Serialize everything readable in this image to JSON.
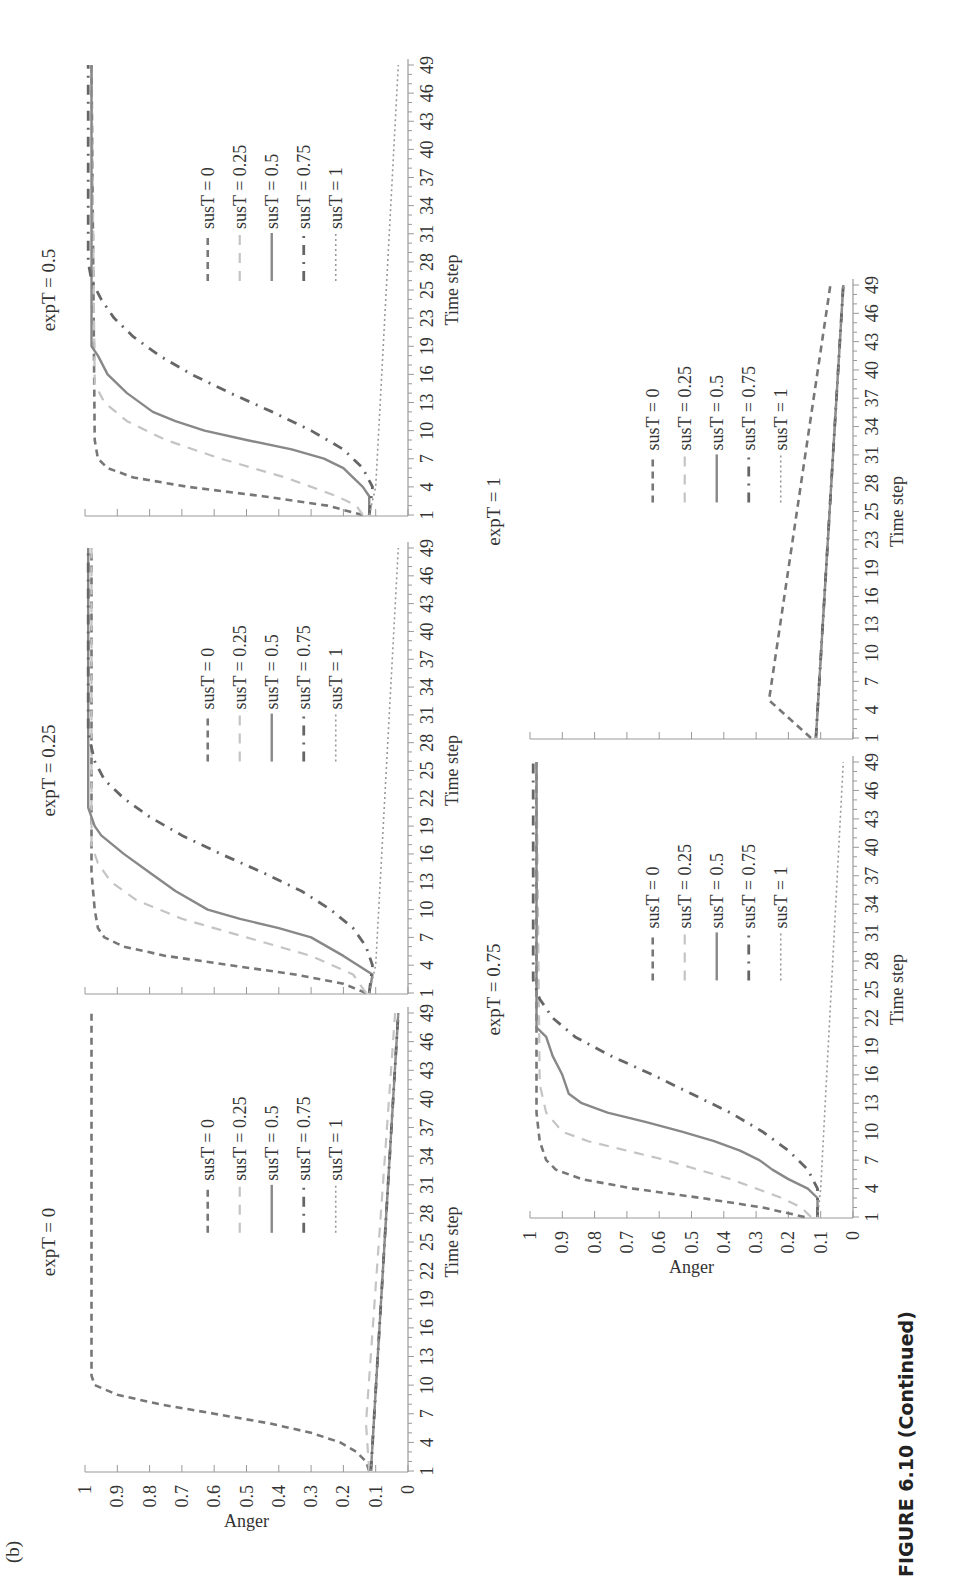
{
  "figure": {
    "panel_label": "(b)",
    "caption": "FIGURE 6.10 (Continued)"
  },
  "legend_labels": [
    "susT = 0",
    "susT = 0.25",
    "susT = 0.5",
    "susT = 0.75",
    "susT = 1"
  ],
  "axis": {
    "xlabel": "Time step",
    "ylabel": "Anger"
  },
  "chart_data": [
    {
      "type": "line",
      "title": "expT = 0",
      "xlabel": "Time step",
      "ylabel": "Anger",
      "ylim": [
        0,
        1
      ],
      "xlim": [
        1,
        49
      ],
      "x_ticks": [
        "1",
        "4",
        "7",
        "10",
        "13",
        "16",
        "19",
        "22",
        "25",
        "28",
        "31",
        "34",
        "37",
        "40",
        "43",
        "46",
        "49"
      ],
      "y_ticks": [
        "0",
        "0.1",
        "0.2",
        "0.3",
        "0.4",
        "0.5",
        "0.6",
        "0.7",
        "0.8",
        "0.9",
        "1"
      ],
      "show_ylabel": true,
      "series": [
        {
          "name": "susT = 0",
          "style": "dash",
          "points": [
            [
              1,
              0.12
            ],
            [
              2,
              0.13
            ],
            [
              3,
              0.16
            ],
            [
              4,
              0.21
            ],
            [
              5,
              0.3
            ],
            [
              6,
              0.43
            ],
            [
              7,
              0.6
            ],
            [
              8,
              0.77
            ],
            [
              9,
              0.9
            ],
            [
              10,
              0.97
            ],
            [
              11,
              0.98
            ],
            [
              49,
              0.98
            ]
          ]
        },
        {
          "name": "susT = 0.25",
          "style": "lightdash",
          "points": [
            [
              1,
              0.12
            ],
            [
              6,
              0.13
            ],
            [
              49,
              0.04
            ]
          ]
        },
        {
          "name": "susT = 0.5",
          "style": "solid",
          "points": [
            [
              1,
              0.115
            ],
            [
              49,
              0.03
            ]
          ]
        },
        {
          "name": "susT = 0.75",
          "style": "dashdot",
          "points": [
            [
              1,
              0.115
            ],
            [
              49,
              0.03
            ]
          ]
        },
        {
          "name": "susT = 1",
          "style": "dot",
          "points": [
            [
              1,
              0.115
            ],
            [
              49,
              0.03
            ]
          ]
        }
      ]
    },
    {
      "type": "line",
      "title": "expT = 0.25",
      "xlabel": "Time step",
      "ylabel": "Anger",
      "ylim": [
        0,
        1
      ],
      "xlim": [
        1,
        49
      ],
      "x_ticks": [
        "1",
        "4",
        "7",
        "10",
        "13",
        "16",
        "19",
        "22",
        "25",
        "28",
        "31",
        "34",
        "37",
        "40",
        "43",
        "46",
        "49"
      ],
      "y_ticks": [
        "0",
        "0.1",
        "0.2",
        "0.3",
        "0.4",
        "0.5",
        "0.6",
        "0.7",
        "0.8",
        "0.9",
        "1"
      ],
      "show_ylabel": false,
      "series": [
        {
          "name": "susT = 0",
          "style": "dash",
          "points": [
            [
              1,
              0.13
            ],
            [
              2,
              0.2
            ],
            [
              3,
              0.35
            ],
            [
              4,
              0.55
            ],
            [
              5,
              0.75
            ],
            [
              6,
              0.88
            ],
            [
              7,
              0.94
            ],
            [
              8,
              0.96
            ],
            [
              10,
              0.97
            ],
            [
              14,
              0.98
            ],
            [
              49,
              0.98
            ]
          ]
        },
        {
          "name": "susT = 0.25",
          "style": "lightdash",
          "points": [
            [
              1,
              0.13
            ],
            [
              3,
              0.17
            ],
            [
              5,
              0.3
            ],
            [
              7,
              0.5
            ],
            [
              9,
              0.7
            ],
            [
              11,
              0.84
            ],
            [
              13,
              0.92
            ],
            [
              15,
              0.96
            ],
            [
              17,
              0.98
            ],
            [
              49,
              0.98
            ]
          ]
        },
        {
          "name": "susT = 0.5",
          "style": "solid",
          "points": [
            [
              1,
              0.12
            ],
            [
              3,
              0.11
            ],
            [
              5,
              0.2
            ],
            [
              7,
              0.3
            ],
            [
              8,
              0.4
            ],
            [
              9,
              0.52
            ],
            [
              10,
              0.62
            ],
            [
              12,
              0.72
            ],
            [
              14,
              0.8
            ],
            [
              16,
              0.88
            ],
            [
              18,
              0.95
            ],
            [
              19,
              0.97
            ],
            [
              21,
              0.99
            ],
            [
              49,
              0.99
            ]
          ]
        },
        {
          "name": "susT = 0.75",
          "style": "dashdot",
          "points": [
            [
              1,
              0.12
            ],
            [
              4,
              0.11
            ],
            [
              6,
              0.13
            ],
            [
              8,
              0.17
            ],
            [
              10,
              0.24
            ],
            [
              12,
              0.33
            ],
            [
              14,
              0.45
            ],
            [
              16,
              0.58
            ],
            [
              18,
              0.7
            ],
            [
              20,
              0.8
            ],
            [
              22,
              0.88
            ],
            [
              24,
              0.94
            ],
            [
              26,
              0.97
            ],
            [
              29,
              0.99
            ],
            [
              49,
              0.99
            ]
          ]
        },
        {
          "name": "susT = 1",
          "style": "dot",
          "points": [
            [
              1,
              0.12
            ],
            [
              4,
              0.1
            ],
            [
              49,
              0.03
            ]
          ]
        }
      ]
    },
    {
      "type": "line",
      "title": "expT = 0.5",
      "xlabel": "Time step",
      "ylabel": "Anger",
      "ylim": [
        0,
        1
      ],
      "xlim": [
        1,
        49
      ],
      "x_ticks": [
        "1",
        "4",
        "7",
        "10",
        "13",
        "16",
        "19",
        "23",
        "25",
        "28",
        "31",
        "34",
        "37",
        "40",
        "43",
        "46",
        "49"
      ],
      "y_ticks": [
        "0",
        "0.1",
        "0.2",
        "0.3",
        "0.4",
        "0.5",
        "0.6",
        "0.7",
        "0.8",
        "0.9",
        "1"
      ],
      "show_ylabel": false,
      "series": [
        {
          "name": "susT = 0",
          "style": "dash",
          "points": [
            [
              1,
              0.14
            ],
            [
              2,
              0.25
            ],
            [
              3,
              0.45
            ],
            [
              4,
              0.68
            ],
            [
              5,
              0.85
            ],
            [
              6,
              0.93
            ],
            [
              7,
              0.96
            ],
            [
              9,
              0.97
            ],
            [
              49,
              0.98
            ]
          ]
        },
        {
          "name": "susT = 0.25",
          "style": "lightdash",
          "points": [
            [
              1,
              0.14
            ],
            [
              2,
              0.16
            ],
            [
              3,
              0.22
            ],
            [
              5,
              0.38
            ],
            [
              7,
              0.58
            ],
            [
              9,
              0.75
            ],
            [
              11,
              0.87
            ],
            [
              13,
              0.94
            ],
            [
              15,
              0.97
            ],
            [
              49,
              0.98
            ]
          ]
        },
        {
          "name": "susT = 0.5",
          "style": "solid",
          "points": [
            [
              1,
              0.12
            ],
            [
              3,
              0.12
            ],
            [
              4,
              0.14
            ],
            [
              6,
              0.2
            ],
            [
              7,
              0.26
            ],
            [
              8,
              0.36
            ],
            [
              9,
              0.5
            ],
            [
              10,
              0.63
            ],
            [
              11,
              0.72
            ],
            [
              12,
              0.79
            ],
            [
              14,
              0.87
            ],
            [
              16,
              0.93
            ],
            [
              18,
              0.96
            ],
            [
              19,
              0.98
            ],
            [
              49,
              0.98
            ]
          ]
        },
        {
          "name": "susT = 0.75",
          "style": "dashdot",
          "points": [
            [
              1,
              0.12
            ],
            [
              4,
              0.11
            ],
            [
              6,
              0.14
            ],
            [
              8,
              0.2
            ],
            [
              10,
              0.3
            ],
            [
              12,
              0.42
            ],
            [
              14,
              0.55
            ],
            [
              16,
              0.67
            ],
            [
              18,
              0.77
            ],
            [
              20,
              0.85
            ],
            [
              22,
              0.91
            ],
            [
              24,
              0.95
            ],
            [
              26,
              0.98
            ],
            [
              28,
              0.99
            ],
            [
              49,
              0.99
            ]
          ]
        },
        {
          "name": "susT = 1",
          "style": "dot",
          "points": [
            [
              1,
              0.12
            ],
            [
              4,
              0.1
            ],
            [
              49,
              0.03
            ]
          ]
        }
      ]
    },
    {
      "type": "line",
      "title": "expT = 0.75",
      "xlabel": "Time step",
      "ylabel": "Anger",
      "ylim": [
        0,
        1
      ],
      "xlim": [
        1,
        49
      ],
      "x_ticks": [
        "1",
        "4",
        "7",
        "10",
        "13",
        "16",
        "19",
        "22",
        "25",
        "28",
        "31",
        "34",
        "37",
        "40",
        "43",
        "46",
        "49"
      ],
      "y_ticks": [
        "0",
        "0.1",
        "0.2",
        "0.3",
        "0.4",
        "0.5",
        "0.6",
        "0.7",
        "0.8",
        "0.9",
        "1"
      ],
      "show_ylabel": true,
      "series": [
        {
          "name": "susT = 0",
          "style": "dash",
          "points": [
            [
              1,
              0.15
            ],
            [
              2,
              0.28
            ],
            [
              3,
              0.47
            ],
            [
              4,
              0.68
            ],
            [
              5,
              0.84
            ],
            [
              6,
              0.92
            ],
            [
              7,
              0.95
            ],
            [
              9,
              0.97
            ],
            [
              12,
              0.98
            ],
            [
              49,
              0.98
            ]
          ]
        },
        {
          "name": "susT = 0.25",
          "style": "lightdash",
          "points": [
            [
              1,
              0.13
            ],
            [
              2,
              0.16
            ],
            [
              3,
              0.22
            ],
            [
              5,
              0.38
            ],
            [
              7,
              0.58
            ],
            [
              8,
              0.7
            ],
            [
              9,
              0.82
            ],
            [
              10,
              0.9
            ],
            [
              12,
              0.95
            ],
            [
              15,
              0.97
            ],
            [
              49,
              0.98
            ]
          ]
        },
        {
          "name": "susT = 0.5",
          "style": "solid",
          "points": [
            [
              1,
              0.11
            ],
            [
              3,
              0.11
            ],
            [
              4,
              0.14
            ],
            [
              5,
              0.2
            ],
            [
              6,
              0.25
            ],
            [
              7,
              0.29
            ],
            [
              8,
              0.35
            ],
            [
              9,
              0.43
            ],
            [
              10,
              0.53
            ],
            [
              11,
              0.64
            ],
            [
              12,
              0.76
            ],
            [
              13,
              0.84
            ],
            [
              14,
              0.88
            ],
            [
              16,
              0.9
            ],
            [
              18,
              0.93
            ],
            [
              20,
              0.95
            ],
            [
              21,
              0.98
            ],
            [
              49,
              0.98
            ]
          ]
        },
        {
          "name": "susT = 0.75",
          "style": "dashdot",
          "points": [
            [
              1,
              0.11
            ],
            [
              4,
              0.11
            ],
            [
              6,
              0.14
            ],
            [
              8,
              0.2
            ],
            [
              10,
              0.28
            ],
            [
              12,
              0.38
            ],
            [
              14,
              0.5
            ],
            [
              16,
              0.62
            ],
            [
              18,
              0.75
            ],
            [
              20,
              0.86
            ],
            [
              22,
              0.93
            ],
            [
              24,
              0.97
            ],
            [
              26,
              0.99
            ],
            [
              49,
              0.99
            ]
          ]
        },
        {
          "name": "susT = 1",
          "style": "dot",
          "points": [
            [
              1,
              0.11
            ],
            [
              4,
              0.1
            ],
            [
              49,
              0.03
            ]
          ]
        }
      ]
    },
    {
      "type": "line",
      "title": "expT = 1",
      "xlabel": "Time step",
      "ylabel": "Anger",
      "ylim": [
        0,
        1
      ],
      "xlim": [
        1,
        49
      ],
      "x_ticks": [
        "1",
        "4",
        "7",
        "10",
        "13",
        "16",
        "19",
        "23",
        "25",
        "28",
        "31",
        "34",
        "37",
        "40",
        "43",
        "46",
        "49"
      ],
      "y_ticks": [
        "0",
        "0.1",
        "0.2",
        "0.3",
        "0.4",
        "0.5",
        "0.6",
        "0.7",
        "0.8",
        "0.9",
        "1"
      ],
      "show_ylabel": false,
      "show_ytick_labels": false,
      "series": [
        {
          "name": "susT = 0",
          "style": "dash",
          "points": [
            [
              1,
              0.13
            ],
            [
              5,
              0.26
            ],
            [
              49,
              0.07
            ]
          ]
        },
        {
          "name": "susT = 0.25",
          "style": "lightdash",
          "points": [
            [
              1,
              0.115
            ],
            [
              49,
              0.03
            ]
          ]
        },
        {
          "name": "susT = 0.5",
          "style": "solid",
          "points": [
            [
              1,
              0.115
            ],
            [
              49,
              0.03
            ]
          ]
        },
        {
          "name": "susT = 0.75",
          "style": "dashdot",
          "points": [
            [
              1,
              0.115
            ],
            [
              49,
              0.03
            ]
          ]
        },
        {
          "name": "susT = 1",
          "style": "dot",
          "points": [
            [
              1,
              0.115
            ],
            [
              49,
              0.03
            ]
          ]
        }
      ]
    }
  ]
}
